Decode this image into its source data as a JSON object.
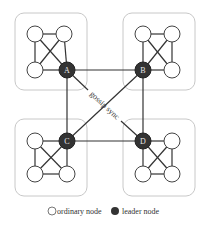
{
  "diagram": {
    "title": "",
    "colors": {
      "group_border": "#c8c8c8",
      "edge": "#333333",
      "ordinary_fill": "#ffffff",
      "ordinary_stroke": "#444444",
      "leader_fill": "#333333",
      "leader_text": "#e8e8e8",
      "label_text": "#333333"
    },
    "groups": [
      {
        "id": "A",
        "box": [
          15,
          13,
          72,
          77
        ],
        "leader": {
          "label": "A",
          "x": 67,
          "y": 70
        },
        "ordinary": [
          {
            "x": 35,
            "y": 34
          },
          {
            "x": 64,
            "y": 34
          },
          {
            "x": 35,
            "y": 70
          }
        ]
      },
      {
        "id": "B",
        "box": [
          123,
          13,
          72,
          77
        ],
        "leader": {
          "label": "B",
          "x": 143,
          "y": 70
        },
        "ordinary": [
          {
            "x": 143,
            "y": 34
          },
          {
            "x": 172,
            "y": 34
          },
          {
            "x": 172,
            "y": 70
          }
        ]
      },
      {
        "id": "C",
        "box": [
          15,
          119,
          72,
          77
        ],
        "leader": {
          "label": "C",
          "x": 67,
          "y": 141
        },
        "ordinary": [
          {
            "x": 35,
            "y": 141
          },
          {
            "x": 35,
            "y": 174
          },
          {
            "x": 67,
            "y": 174
          }
        ]
      },
      {
        "id": "D",
        "box": [
          123,
          119,
          72,
          77
        ],
        "leader": {
          "label": "D",
          "x": 143,
          "y": 141
        },
        "ordinary": [
          {
            "x": 172,
            "y": 141
          },
          {
            "x": 143,
            "y": 174
          },
          {
            "x": 172,
            "y": 174
          }
        ]
      }
    ],
    "leader_edges": [
      [
        "A",
        "B"
      ],
      [
        "A",
        "C"
      ],
      [
        "B",
        "D"
      ],
      [
        "C",
        "D"
      ],
      [
        "A",
        "D"
      ],
      [
        "B",
        "C"
      ]
    ],
    "edge_label": "gossip sync",
    "legend": {
      "ordinary_label": "ordinary node",
      "leader_label": "leader node"
    }
  }
}
